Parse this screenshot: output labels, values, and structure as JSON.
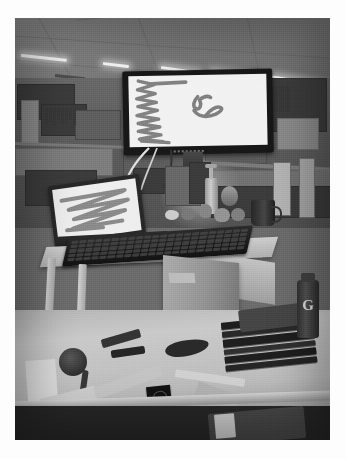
{
  "image": {
    "kind": "photograph",
    "subject": "office desk workspace with standing desk riser",
    "color_mode": "grayscale",
    "caption": "Grainy black and white photo of a cubicle desk: a wide monitor and an open laptop both display gray scribble drawings, with a keyboard on a standing desk riser and assorted desk clutter.",
    "border_color": "#ffffff",
    "photo_bg": "#6e6e6e"
  },
  "scene": {
    "ceiling": {
      "label": "drop ceiling tiles",
      "light_fixtures": 5,
      "fixture_color": "#f2f1ec"
    },
    "background": {
      "label": "open plan office cubicles",
      "elements": [
        "cubicle partitions",
        "overhead shelves",
        "binder row",
        "window glow"
      ]
    },
    "monitor": {
      "label": "widescreen desktop monitor",
      "bezel_color": "#1c1c1c",
      "screen_color": "#efeee9",
      "content": "gray scribble drawing"
    },
    "laptop": {
      "label": "open laptop",
      "body_color": "#2b2b2b",
      "screen_color": "#eceae4",
      "content": "gray zigzag scribble"
    },
    "keyboard": {
      "label": "full size black keyboard",
      "color": "#1f1e1c"
    },
    "riser": {
      "label": "standing desk riser",
      "color": "#cfcabd"
    },
    "desk": {
      "label": "desk surface",
      "color": "#c3bdaf"
    },
    "objects": [
      {
        "name": "cardboard-box",
        "label": "cardboard box with handle cutout"
      },
      {
        "name": "book-stack",
        "label": "stack of dark binders and books"
      },
      {
        "name": "gatorade-bottle",
        "label": "Gatorade bottle",
        "logo_text": "G"
      },
      {
        "name": "coffee-mug",
        "label": "dark coffee mug"
      },
      {
        "name": "pump-bottle",
        "label": "hand sanitizer pump bottle"
      },
      {
        "name": "desk-toys",
        "label": "small figurines and desk toys"
      },
      {
        "name": "phone-card",
        "label": "small dark card or phone on desk"
      },
      {
        "name": "hand-tools",
        "label": "assorted tools and cables"
      },
      {
        "name": "paper-scraps",
        "label": "loose papers and scraps"
      }
    ]
  },
  "scribbles": {
    "monitor_drawing": {
      "type": "freehand ink strokes on white canvas",
      "stroke_color": "#7c7a76",
      "strokes": [
        {
          "name": "vertical-zigzag",
          "description": "tall dense vertical zigzag column on the left"
        },
        {
          "name": "horizontal-tail",
          "description": "short horizontal stroke extending right from the top of the zigzag"
        },
        {
          "name": "cursive-squiggle",
          "description": "small cursive u-shaped squiggle with a trailing sweep in the center"
        }
      ]
    },
    "laptop_drawing": {
      "type": "freehand ink strokes on white canvas",
      "stroke_color": "#85837e",
      "strokes": [
        {
          "name": "horizontal-zigzag",
          "description": "broad horizontal zigzag filling the screen"
        }
      ]
    }
  }
}
